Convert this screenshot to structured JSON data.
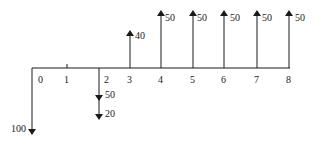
{
  "diagram": {
    "type": "cash-flow-diagram",
    "axis": {
      "periods": [
        "0",
        "1",
        "2",
        "3",
        "4",
        "5",
        "6",
        "7",
        "8"
      ]
    },
    "flows": [
      {
        "period": "0",
        "direction": "down",
        "amount": "100"
      },
      {
        "period": "2",
        "direction": "down",
        "amount": "50"
      },
      {
        "period": "2",
        "direction": "down",
        "amount": "20"
      },
      {
        "period": "3",
        "direction": "up",
        "amount": "40"
      },
      {
        "period": "4",
        "direction": "up",
        "amount": "50"
      },
      {
        "period": "5",
        "direction": "up",
        "amount": "50"
      },
      {
        "period": "6",
        "direction": "up",
        "amount": "50"
      },
      {
        "period": "7",
        "direction": "up",
        "amount": "50"
      },
      {
        "period": "8",
        "direction": "up",
        "amount": "50"
      }
    ],
    "color": "#1a1a1a"
  }
}
